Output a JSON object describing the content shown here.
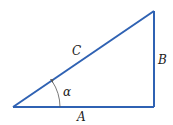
{
  "diagram": {
    "type": "right-triangle",
    "colors": {
      "line": "#2f62b3",
      "text": "#222222",
      "arc": "#555555"
    },
    "labels": {
      "hypotenuse": "C",
      "opposite": "B",
      "adjacent": "A",
      "angle": "α"
    }
  }
}
